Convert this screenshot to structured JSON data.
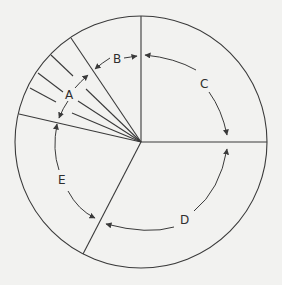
{
  "diagram": {
    "type": "circle-sector-diagram",
    "center": [
      141,
      142
    ],
    "radius": 126,
    "segments": [
      {
        "label": "A",
        "description": "small wedge subdivided by several thin lines (upper-left)"
      },
      {
        "label": "B",
        "description": "narrow wedge between A and vertical divider (top)"
      },
      {
        "label": "C",
        "description": "upper-right quadrant"
      },
      {
        "label": "D",
        "description": "lower-right region"
      },
      {
        "label": "E",
        "description": "left region"
      }
    ],
    "labels": {
      "a": "A",
      "b": "B",
      "c": "C",
      "d": "D",
      "e": "E"
    },
    "colors": {
      "line": "#3a3a3a",
      "background": "#f2f2f0"
    }
  }
}
